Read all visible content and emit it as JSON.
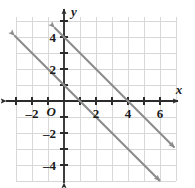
{
  "chart_data": {
    "type": "line",
    "title": "",
    "xlabel": "x",
    "ylabel": "y",
    "origin_label": "O",
    "xlim": [
      -3.2,
      7.6
    ],
    "ylim": [
      -5.2,
      5.0
    ],
    "grid": true,
    "grid_step": 1,
    "legend": "none",
    "xticks": [
      -2,
      2,
      4,
      6
    ],
    "xtick_labels": [
      "–2",
      "2",
      "4",
      "6"
    ],
    "yticks": [
      4,
      2,
      -2,
      -4
    ],
    "ytick_labels": [
      "4",
      "2",
      "–2",
      "–4"
    ],
    "x_minor_ticks": [
      -3,
      -2,
      -1,
      1,
      2,
      3,
      4,
      5,
      6,
      7
    ],
    "y_minor_ticks": [
      -5,
      -4,
      -3,
      -2,
      -1,
      1,
      2,
      3,
      4
    ],
    "series": [
      {
        "name": "line-upper",
        "equation": "y = -x + 4",
        "slope": -1,
        "intercept": 4,
        "x_intercept": 4,
        "y_intercept": 4,
        "points": [
          [
            -0.6,
            4.6
          ],
          [
            6.9,
            -2.9
          ]
        ],
        "arrows": "both",
        "color": "#8c8c8c"
      },
      {
        "name": "line-lower",
        "equation": "y = -x + 1",
        "slope": -1,
        "intercept": 1,
        "x_intercept": 1,
        "y_intercept": 1,
        "points": [
          [
            -3.1,
            4.1
          ],
          [
            6.0,
            -5.0
          ]
        ],
        "arrows": "both",
        "color": "#8c8c8c"
      }
    ]
  },
  "style": {
    "background": "#ffffff",
    "grid_color": "#d8d8d8",
    "axis_color": "#2b2b2b",
    "line_color": "#8c8c8c",
    "label_color": "#1a1a1a"
  }
}
